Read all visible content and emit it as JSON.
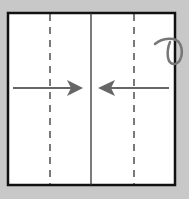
{
  "diagram": {
    "type": "origami-fold-step",
    "background": "#c8c8c8",
    "paper": {
      "fill": "#ffffff",
      "stroke": "#111111",
      "x": 8,
      "y": 13,
      "width": 167,
      "height": 172
    },
    "center_crease": {
      "kind": "valley-fold-line",
      "style": "solid",
      "x": 91,
      "color": "#333333"
    },
    "fold_lines": [
      {
        "kind": "valley-fold",
        "style": "dashed",
        "x": 50
      },
      {
        "kind": "valley-fold",
        "style": "dashed",
        "x": 134
      }
    ],
    "arrows": [
      {
        "from_x": 13,
        "to_x": 83,
        "y": 88,
        "direction": "right",
        "color": "#666666"
      },
      {
        "from_x": 169,
        "to_x": 98,
        "y": 88,
        "direction": "left",
        "color": "#666666"
      }
    ],
    "symbols": [
      {
        "name": "turn-over",
        "x": 166,
        "y": 52,
        "color": "#777777"
      }
    ]
  }
}
